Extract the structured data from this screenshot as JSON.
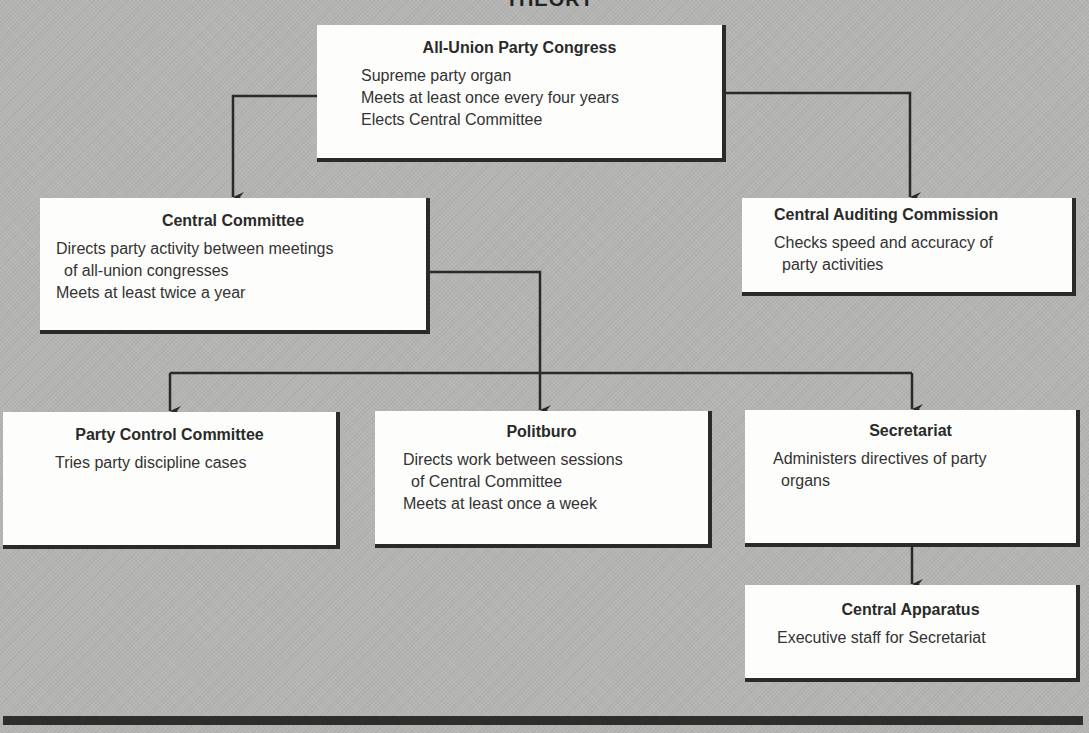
{
  "heading": "THEORY",
  "colors": {
    "background": "#b5b5b3",
    "box_fill": "#fdfdfb",
    "box_shadow": "#2a2a2a",
    "connector": "#2a2a2a",
    "text": "#2b2b2b"
  },
  "nodes": {
    "congress": {
      "title": "All-Union Party Congress",
      "lines": [
        "Supreme party organ",
        "Meets at least once every four years",
        "Elects Central Committee"
      ]
    },
    "central_committee": {
      "title": "Central Committee",
      "lines": [
        "Directs party activity between meetings",
        "of all-union congresses",
        "Meets at least twice a year"
      ]
    },
    "auditing": {
      "title": "Central Auditing Commission",
      "lines": [
        "Checks speed and accuracy of",
        "party activities"
      ]
    },
    "party_control": {
      "title": "Party Control Committee",
      "lines": [
        "Tries party discipline cases"
      ]
    },
    "politburo": {
      "title": "Politburo",
      "lines": [
        "Directs work between sessions",
        "of Central Committee",
        "Meets at least once a week"
      ]
    },
    "secretariat": {
      "title": "Secretariat",
      "lines": [
        "Administers directives of party",
        "organs"
      ]
    },
    "apparatus": {
      "title": "Central Apparatus",
      "lines": [
        "Executive staff for Secretariat"
      ]
    }
  },
  "edges": [
    {
      "from": "All-Union Party Congress",
      "to": "Central Committee"
    },
    {
      "from": "All-Union Party Congress",
      "to": "Central Auditing Commission"
    },
    {
      "from": "Central Committee",
      "to": "Party Control Committee"
    },
    {
      "from": "Central Committee",
      "to": "Politburo"
    },
    {
      "from": "Central Committee",
      "to": "Secretariat"
    },
    {
      "from": "Secretariat",
      "to": "Central Apparatus"
    }
  ]
}
